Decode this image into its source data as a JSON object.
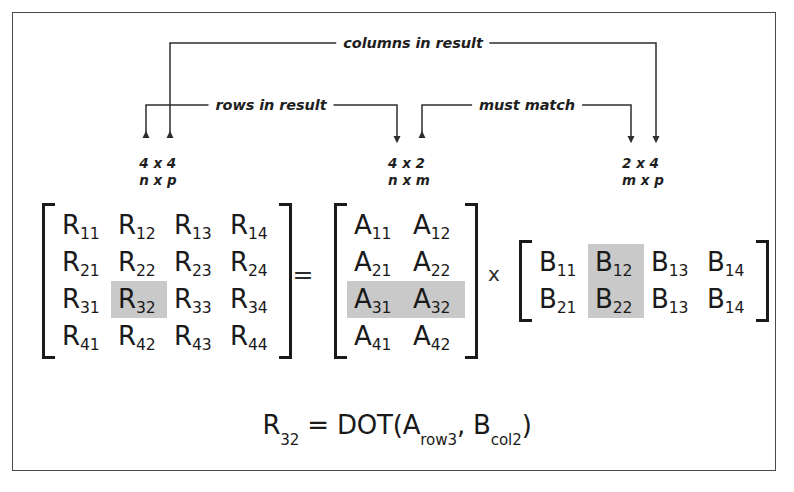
{
  "figure": {
    "border_color": "#4a4a4a",
    "highlight_color": "#c9c9c9",
    "ink_color": "#1a1a1a"
  },
  "annotations": {
    "columns_in_result": "columns in result",
    "rows_in_result": "rows in result",
    "must_match": "must match"
  },
  "dimensions": {
    "result": {
      "numeric": "4 x 4",
      "symbolic": "n x p"
    },
    "a": {
      "numeric": "4 x 2",
      "symbolic": "n x m"
    },
    "b": {
      "numeric": "2 x 4",
      "symbolic": "m x p"
    }
  },
  "operators": {
    "equals": "=",
    "times": "x"
  },
  "matrices": {
    "result": {
      "name": "R",
      "rows": 4,
      "cols": 4,
      "cells": [
        [
          {
            "base": "R",
            "sub": "11",
            "hl": false
          },
          {
            "base": "R",
            "sub": "12",
            "hl": false
          },
          {
            "base": "R",
            "sub": "13",
            "hl": false
          },
          {
            "base": "R",
            "sub": "14",
            "hl": false
          }
        ],
        [
          {
            "base": "R",
            "sub": "21",
            "hl": false
          },
          {
            "base": "R",
            "sub": "22",
            "hl": false
          },
          {
            "base": "R",
            "sub": "23",
            "hl": false
          },
          {
            "base": "R",
            "sub": "24",
            "hl": false
          }
        ],
        [
          {
            "base": "R",
            "sub": "31",
            "hl": false
          },
          {
            "base": "R",
            "sub": "32",
            "hl": true
          },
          {
            "base": "R",
            "sub": "33",
            "hl": false
          },
          {
            "base": "R",
            "sub": "34",
            "hl": false
          }
        ],
        [
          {
            "base": "R",
            "sub": "41",
            "hl": false
          },
          {
            "base": "R",
            "sub": "42",
            "hl": false
          },
          {
            "base": "R",
            "sub": "43",
            "hl": false
          },
          {
            "base": "R",
            "sub": "44",
            "hl": false
          }
        ]
      ]
    },
    "a": {
      "name": "A",
      "rows": 4,
      "cols": 2,
      "cells": [
        [
          {
            "base": "A",
            "sub": "11",
            "hl": false
          },
          {
            "base": "A",
            "sub": "12",
            "hl": false
          }
        ],
        [
          {
            "base": "A",
            "sub": "21",
            "hl": false
          },
          {
            "base": "A",
            "sub": "22",
            "hl": false
          }
        ],
        [
          {
            "base": "A",
            "sub": "31",
            "hl": true
          },
          {
            "base": "A",
            "sub": "32",
            "hl": true
          }
        ],
        [
          {
            "base": "A",
            "sub": "41",
            "hl": false
          },
          {
            "base": "A",
            "sub": "42",
            "hl": false
          }
        ]
      ]
    },
    "b": {
      "name": "B",
      "rows": 2,
      "cols": 4,
      "cells": [
        [
          {
            "base": "B",
            "sub": "11",
            "hl": false
          },
          {
            "base": "B",
            "sub": "12",
            "hl": true
          },
          {
            "base": "B",
            "sub": "13",
            "hl": false
          },
          {
            "base": "B",
            "sub": "14",
            "hl": false
          }
        ],
        [
          {
            "base": "B",
            "sub": "21",
            "hl": false
          },
          {
            "base": "B",
            "sub": "22",
            "hl": true
          },
          {
            "base": "B",
            "sub": "13",
            "hl": false
          },
          {
            "base": "B",
            "sub": "14",
            "hl": false
          }
        ]
      ]
    }
  },
  "formula": {
    "lhs_base": "R",
    "lhs_sub": "32",
    "equals": " = ",
    "fn": "DOT(",
    "arg1_base": "A",
    "arg1_sub": "row3",
    "separator": ", ",
    "arg2_base": "B",
    "arg2_sub": "col2",
    "close": ")"
  }
}
